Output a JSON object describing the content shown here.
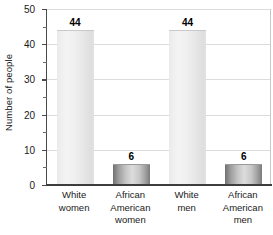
{
  "chart_data": {
    "type": "bar",
    "title": "",
    "xlabel": "",
    "ylabel": "Number of people",
    "ylim": [
      0,
      50
    ],
    "ytick_step": 10,
    "yminor_step": 5,
    "grid": true,
    "legend": null,
    "categories": [
      "White women",
      "African American women",
      "White men",
      "African American men"
    ],
    "category_lines": [
      [
        "White",
        "women"
      ],
      [
        "African",
        "American",
        "women"
      ],
      [
        "White",
        "men"
      ],
      [
        "African",
        "American",
        "men"
      ]
    ],
    "values": [
      44,
      6,
      44,
      6
    ],
    "value_labels": [
      "44",
      "6",
      "44",
      "6"
    ],
    "ytick_labels": [
      "0",
      "10",
      "20",
      "30",
      "40",
      "50"
    ],
    "colors": {
      "bar_tall": "#eeeeee",
      "bar_short": "#9e9e9e",
      "axis": "#3d3d3d",
      "gridline": "#dcdcdc",
      "text": "#1a1a1a",
      "background": "#ffffff"
    }
  }
}
